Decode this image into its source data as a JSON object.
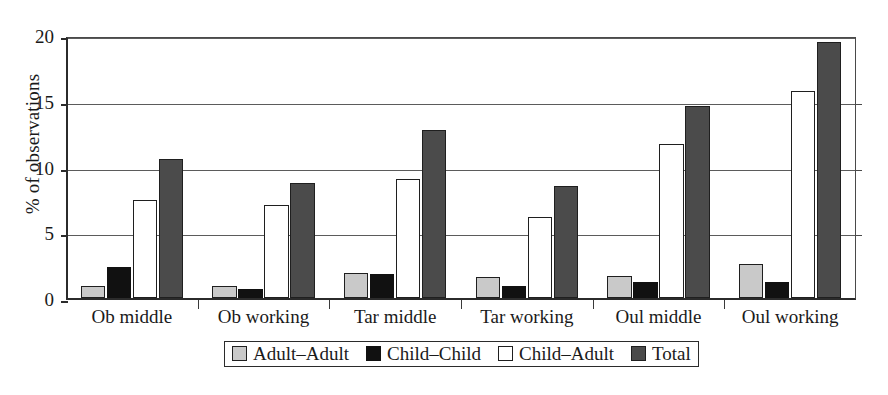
{
  "chart_data": {
    "type": "bar",
    "title": "",
    "xlabel": "",
    "ylabel": "% of observations",
    "ylim": [
      0,
      20
    ],
    "yticks": [
      0,
      5,
      10,
      15,
      20
    ],
    "grid": true,
    "legend_position": "bottom",
    "categories": [
      "Ob middle",
      "Ob working",
      "Tar middle",
      "Tar working",
      "Oul middle",
      "Oul working"
    ],
    "series": [
      {
        "name": "Adult–Adult",
        "color": "#c9c9c9",
        "values": [
          0.95,
          0.95,
          1.9,
          1.6,
          1.7,
          2.6
        ]
      },
      {
        "name": "Child–Child",
        "color": "#111111",
        "values": [
          2.35,
          0.7,
          1.85,
          0.95,
          1.25,
          1.2
        ]
      },
      {
        "name": "Child–Adult",
        "color": "#ffffff",
        "values": [
          7.45,
          7.1,
          9.05,
          6.15,
          11.75,
          15.75
        ]
      },
      {
        "name": "Total",
        "color": "#4b4b4b",
        "values": [
          10.6,
          8.75,
          12.75,
          8.55,
          14.6,
          19.5
        ]
      }
    ]
  },
  "axis": {
    "y_title": "% of observations",
    "y_tick_labels": [
      "0",
      "5",
      "10",
      "15",
      "20"
    ]
  },
  "legend": {
    "items": [
      {
        "label": "Adult–Adult",
        "swatch": "swatch-adult-adult"
      },
      {
        "label": "Child–Child",
        "swatch": "swatch-child-child"
      },
      {
        "label": "Child–Adult",
        "swatch": "swatch-child-adult"
      },
      {
        "label": "Total",
        "swatch": "swatch-total"
      }
    ]
  }
}
